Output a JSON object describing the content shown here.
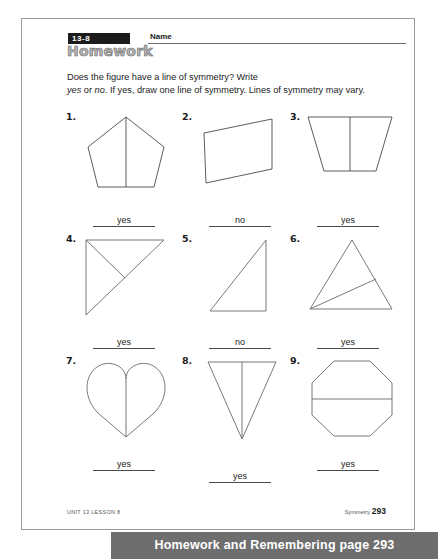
{
  "header": {
    "lesson_badge": "13-8",
    "title": "Homework",
    "name_label": "Name"
  },
  "instructions": {
    "line1_pre": "Does the figure have a line of symmetry? Write",
    "line2_a": "yes",
    "line2_b": " or ",
    "line2_c": "no",
    "line2_d": ". If yes, draw one line of symmetry.  Lines of symmetry may vary."
  },
  "problems": [
    {
      "number": "1.",
      "shape": "pentagon",
      "symmetry_line": "vertical",
      "answer": "yes"
    },
    {
      "number": "2.",
      "shape": "parallelogram",
      "symmetry_line": "none",
      "answer": "no"
    },
    {
      "number": "3.",
      "shape": "trapezoid",
      "symmetry_line": "vertical",
      "answer": "yes"
    },
    {
      "number": "4.",
      "shape": "right-triangle",
      "symmetry_line": "diagonal",
      "answer": "yes"
    },
    {
      "number": "5.",
      "shape": "right-triangle-scalene",
      "symmetry_line": "none",
      "answer": "no"
    },
    {
      "number": "6.",
      "shape": "triangle",
      "symmetry_line": "diagonal",
      "answer": "yes"
    },
    {
      "number": "7.",
      "shape": "heart",
      "symmetry_line": "vertical",
      "answer": "yes"
    },
    {
      "number": "8.",
      "shape": "inverted-narrow-triangle",
      "symmetry_line": "vertical",
      "answer": "yes"
    },
    {
      "number": "9.",
      "shape": "octagon",
      "symmetry_line": "horizontal",
      "answer": "yes"
    }
  ],
  "footer": {
    "left": "UNIT 13 LESSON 8",
    "right_label": "Symmetry",
    "page_number": "293"
  },
  "caption": {
    "text": "Homework and Remembering page 293"
  },
  "colors": {
    "badge_bg": "#1b1b1b",
    "title_fill": "#b8b8b8",
    "banner_bg": "#6e6e6e",
    "ink": "#1b1b1b",
    "stroke": "#555555"
  }
}
